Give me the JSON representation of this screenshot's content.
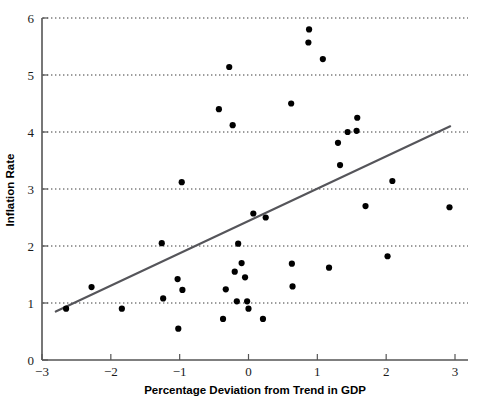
{
  "chart_data": {
    "type": "scatter",
    "title": "",
    "xlabel": "Percentage Deviation from Trend in GDP",
    "ylabel": "Inflation Rate",
    "xlim": [
      -3,
      3
    ],
    "ylim": [
      0,
      6
    ],
    "xticks": [
      -3,
      -2,
      -1,
      0,
      1,
      2,
      3
    ],
    "xtick_labels": [
      "−3",
      "−2",
      "−1",
      "0",
      "1",
      "2",
      "3"
    ],
    "yticks": [
      0,
      1,
      2,
      3,
      4,
      5,
      6
    ],
    "ytick_labels": [
      "0",
      "1",
      "2",
      "3",
      "4",
      "5",
      "6"
    ],
    "grid": "horizontal-dotted",
    "gridlines_y": [
      1,
      2,
      3,
      4,
      5,
      6
    ],
    "legend": null,
    "marker": "filled-circle",
    "marker_color": "#000000",
    "point_count": 42,
    "points": [
      {
        "x": -2.65,
        "y": 0.9
      },
      {
        "x": -2.28,
        "y": 1.28
      },
      {
        "x": -1.84,
        "y": 0.9
      },
      {
        "x": -1.26,
        "y": 2.05
      },
      {
        "x": -1.24,
        "y": 1.08
      },
      {
        "x": -1.03,
        "y": 1.42
      },
      {
        "x": -1.02,
        "y": 0.55
      },
      {
        "x": -0.97,
        "y": 3.12
      },
      {
        "x": -0.96,
        "y": 1.23
      },
      {
        "x": -0.43,
        "y": 4.4
      },
      {
        "x": -0.37,
        "y": 0.72
      },
      {
        "x": -0.33,
        "y": 1.24
      },
      {
        "x": -0.28,
        "y": 5.14
      },
      {
        "x": -0.23,
        "y": 4.12
      },
      {
        "x": -0.2,
        "y": 1.55
      },
      {
        "x": -0.17,
        "y": 1.03
      },
      {
        "x": -0.15,
        "y": 2.04
      },
      {
        "x": -0.1,
        "y": 1.7
      },
      {
        "x": -0.05,
        "y": 1.45
      },
      {
        "x": -0.02,
        "y": 1.03
      },
      {
        "x": 0.0,
        "y": 0.9
      },
      {
        "x": 0.07,
        "y": 2.57
      },
      {
        "x": 0.21,
        "y": 0.72
      },
      {
        "x": 0.25,
        "y": 2.5
      },
      {
        "x": 0.62,
        "y": 4.5
      },
      {
        "x": 0.63,
        "y": 1.69
      },
      {
        "x": 0.64,
        "y": 1.29
      },
      {
        "x": 0.87,
        "y": 5.57
      },
      {
        "x": 0.88,
        "y": 5.8
      },
      {
        "x": 1.08,
        "y": 5.28
      },
      {
        "x": 1.17,
        "y": 1.62
      },
      {
        "x": 1.3,
        "y": 3.81
      },
      {
        "x": 1.33,
        "y": 3.42
      },
      {
        "x": 1.44,
        "y": 4.0
      },
      {
        "x": 1.57,
        "y": 4.02
      },
      {
        "x": 1.58,
        "y": 4.25
      },
      {
        "x": 1.7,
        "y": 2.7
      },
      {
        "x": 2.02,
        "y": 1.82
      },
      {
        "x": 2.09,
        "y": 3.14
      },
      {
        "x": 2.92,
        "y": 2.68
      }
    ],
    "trend_line": {
      "type": "linear-fit",
      "x_start": -2.8,
      "y_start": 0.85,
      "x_end": 2.93,
      "y_end": 4.1,
      "color": "#55555a"
    }
  }
}
